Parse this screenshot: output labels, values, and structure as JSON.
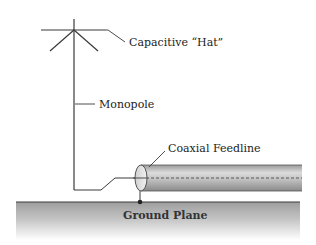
{
  "diagram": {
    "type": "antenna-schematic",
    "labels": {
      "capacitive_hat": "Capacitive “Hat”",
      "monopole": "Monopole",
      "coaxial_feedline": "Coaxial Feedline",
      "ground_plane": "Ground Plane"
    },
    "colors": {
      "line": "#3a3a3a",
      "coax_dark": "#8c8c8c",
      "coax_light": "#d8d8d8",
      "ground_top": "#a0a0a0",
      "ground_bottom": "#ffffff",
      "text": "#222222"
    }
  }
}
